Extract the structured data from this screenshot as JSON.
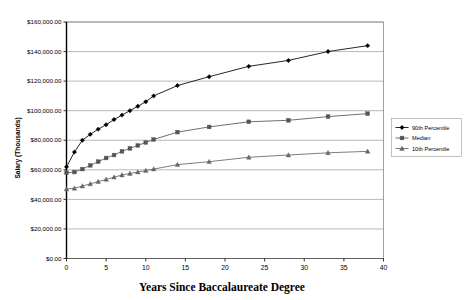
{
  "chart_data": {
    "type": "line",
    "title": "",
    "xlabel": "Years Since Baccalaureate Degree",
    "ylabel": "Salary (Thousands)",
    "xlim": [
      0,
      40
    ],
    "ylim": [
      0,
      160000
    ],
    "grid": true,
    "legend_position": "right",
    "x_ticks": [
      0,
      5,
      10,
      15,
      20,
      25,
      30,
      35,
      40
    ],
    "x_tick_labels": [
      "0",
      "5",
      "10",
      "15",
      "20",
      "25",
      "30",
      "35",
      "40"
    ],
    "y_ticks": [
      0,
      20000,
      40000,
      60000,
      80000,
      100000,
      120000,
      140000,
      160000
    ],
    "y_tick_labels": [
      "$0.00",
      "$20,000.00",
      "$40,000.00",
      "$60,000.00",
      "$80,000.00",
      "$100,000.00",
      "$120,000.00",
      "$140,000.00",
      "$160,000.00"
    ],
    "x": [
      0,
      1,
      2,
      3,
      4,
      5,
      6,
      7,
      8,
      9,
      10,
      11,
      14,
      18,
      23,
      28,
      33,
      38
    ],
    "series": [
      {
        "name": "90th Percentile",
        "marker": "diamond",
        "color": "#000000",
        "values": [
          62000,
          72000,
          80000,
          84000,
          87500,
          90500,
          94000,
          97000,
          100000,
          103000,
          106000,
          110000,
          117000,
          123000,
          130000,
          134000,
          140000,
          144000
        ]
      },
      {
        "name": "Median",
        "marker": "square",
        "color": "#555555",
        "values": [
          58000,
          58500,
          60500,
          63000,
          65500,
          68000,
          70000,
          72500,
          74500,
          76500,
          78500,
          80500,
          85500,
          89000,
          92500,
          93500,
          96000,
          98000
        ]
      },
      {
        "name": "10th Percentile",
        "marker": "triangle",
        "color": "#666666",
        "values": [
          47000,
          47500,
          49000,
          50500,
          52000,
          53500,
          55000,
          56500,
          57500,
          58500,
          59500,
          60500,
          63500,
          65500,
          68500,
          70000,
          71500,
          72500
        ]
      }
    ]
  },
  "legend": {
    "items": [
      {
        "label": "90th Percentile"
      },
      {
        "label": "Median"
      },
      {
        "label": "10th Percentile"
      }
    ]
  }
}
